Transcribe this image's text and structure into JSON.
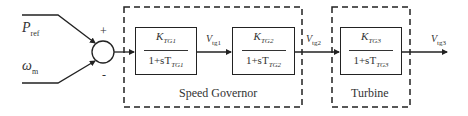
{
  "inputs": {
    "top": {
      "symbol": "P",
      "sub": "ref",
      "sign": "+"
    },
    "bottom": {
      "symbol": "ω",
      "sub": "m",
      "sign": "-"
    }
  },
  "groups": [
    {
      "caption": "Speed Governor"
    },
    {
      "caption": "Turbine"
    }
  ],
  "blocks": [
    {
      "num_k": "K",
      "num_sub": "TG1",
      "den_prefix": "1+sT",
      "den_sub": "TG1"
    },
    {
      "num_k": "K",
      "num_sub": "TG2",
      "den_prefix": "1+sT",
      "den_sub": "TG2"
    },
    {
      "num_k": "K",
      "num_sub": "TG3",
      "den_prefix": "1+sT",
      "den_sub": "TG3"
    }
  ],
  "signals": [
    {
      "symbol": "V",
      "sub": "tg1"
    },
    {
      "symbol": "V",
      "sub": "tg2"
    },
    {
      "symbol": "V",
      "sub": "tg3"
    }
  ]
}
